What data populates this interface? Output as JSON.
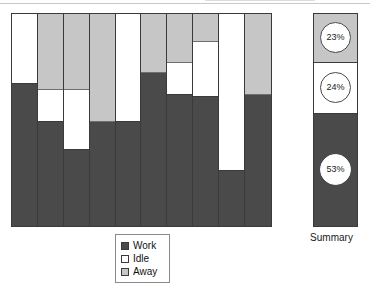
{
  "chart_data": {
    "type": "bar",
    "title": "",
    "xlabel": "",
    "ylabel": "",
    "ylim": [
      0,
      100
    ],
    "grid": false,
    "stacked": true,
    "stack_order_top_to_bottom": [
      "Away",
      "Idle",
      "Work"
    ],
    "categories": [
      "1",
      "2",
      "3",
      "4",
      "5",
      "6",
      "7",
      "8",
      "9",
      "10"
    ],
    "legend": {
      "position": "bottom-center",
      "entries": [
        {
          "label": "Work",
          "color": "#4a4a4a",
          "icon": "legend-swatch-work"
        },
        {
          "label": "Idle",
          "color": "#ffffff",
          "icon": "legend-swatch-idle"
        },
        {
          "label": "Away",
          "color": "#c6c6c6",
          "icon": "legend-swatch-away"
        }
      ]
    },
    "series": [
      {
        "name": "Away",
        "color": "#c6c6c6",
        "values": [
          0,
          36,
          36,
          51,
          0,
          28,
          23,
          13,
          0,
          38
        ]
      },
      {
        "name": "Idle",
        "color": "#ffffff",
        "values": [
          33,
          15,
          28,
          0,
          51,
          0,
          15,
          26,
          74,
          0
        ]
      },
      {
        "name": "Work",
        "color": "#4a4a4a",
        "values": [
          67,
          49,
          36,
          49,
          49,
          72,
          62,
          61,
          26,
          62
        ]
      }
    ],
    "bars": [
      {
        "category": "1",
        "segments": [
          {
            "name": "Idle",
            "value": 33
          },
          {
            "name": "Work",
            "value": 67
          }
        ]
      },
      {
        "category": "2",
        "segments": [
          {
            "name": "Away",
            "value": 36
          },
          {
            "name": "Idle",
            "value": 15
          },
          {
            "name": "Work",
            "value": 49
          }
        ]
      },
      {
        "category": "3",
        "segments": [
          {
            "name": "Away",
            "value": 36
          },
          {
            "name": "Idle",
            "value": 28
          },
          {
            "name": "Work",
            "value": 36
          }
        ]
      },
      {
        "category": "4",
        "segments": [
          {
            "name": "Away",
            "value": 51
          },
          {
            "name": "Work",
            "value": 49
          }
        ]
      },
      {
        "category": "5",
        "segments": [
          {
            "name": "Idle",
            "value": 51
          },
          {
            "name": "Work",
            "value": 49
          }
        ]
      },
      {
        "category": "6",
        "segments": [
          {
            "name": "Away",
            "value": 28
          },
          {
            "name": "Work",
            "value": 72
          }
        ]
      },
      {
        "category": "7",
        "segments": [
          {
            "name": "Away",
            "value": 23
          },
          {
            "name": "Idle",
            "value": 15
          },
          {
            "name": "Work",
            "value": 62
          }
        ]
      },
      {
        "category": "8",
        "segments": [
          {
            "name": "Away",
            "value": 13
          },
          {
            "name": "Idle",
            "value": 26
          },
          {
            "name": "Work",
            "value": 61
          }
        ]
      },
      {
        "category": "9",
        "segments": [
          {
            "name": "Idle",
            "value": 74
          },
          {
            "name": "Work",
            "value": 26
          }
        ]
      },
      {
        "category": "10",
        "segments": [
          {
            "name": "Away",
            "value": 38
          },
          {
            "name": "Work",
            "value": 62
          }
        ]
      }
    ],
    "summary": {
      "label": "Summary",
      "segments": [
        {
          "name": "Away",
          "value": 23,
          "label": "23%"
        },
        {
          "name": "Idle",
          "value": 24,
          "label": "24%"
        },
        {
          "name": "Work",
          "value": 53,
          "label": "53%"
        }
      ]
    }
  },
  "colors": {
    "work": "#4a4a4a",
    "idle": "#ffffff",
    "away": "#c6c6c6",
    "outline": "#3a3a3a",
    "legend_border": "#8a8a8a",
    "text": "#111111"
  }
}
